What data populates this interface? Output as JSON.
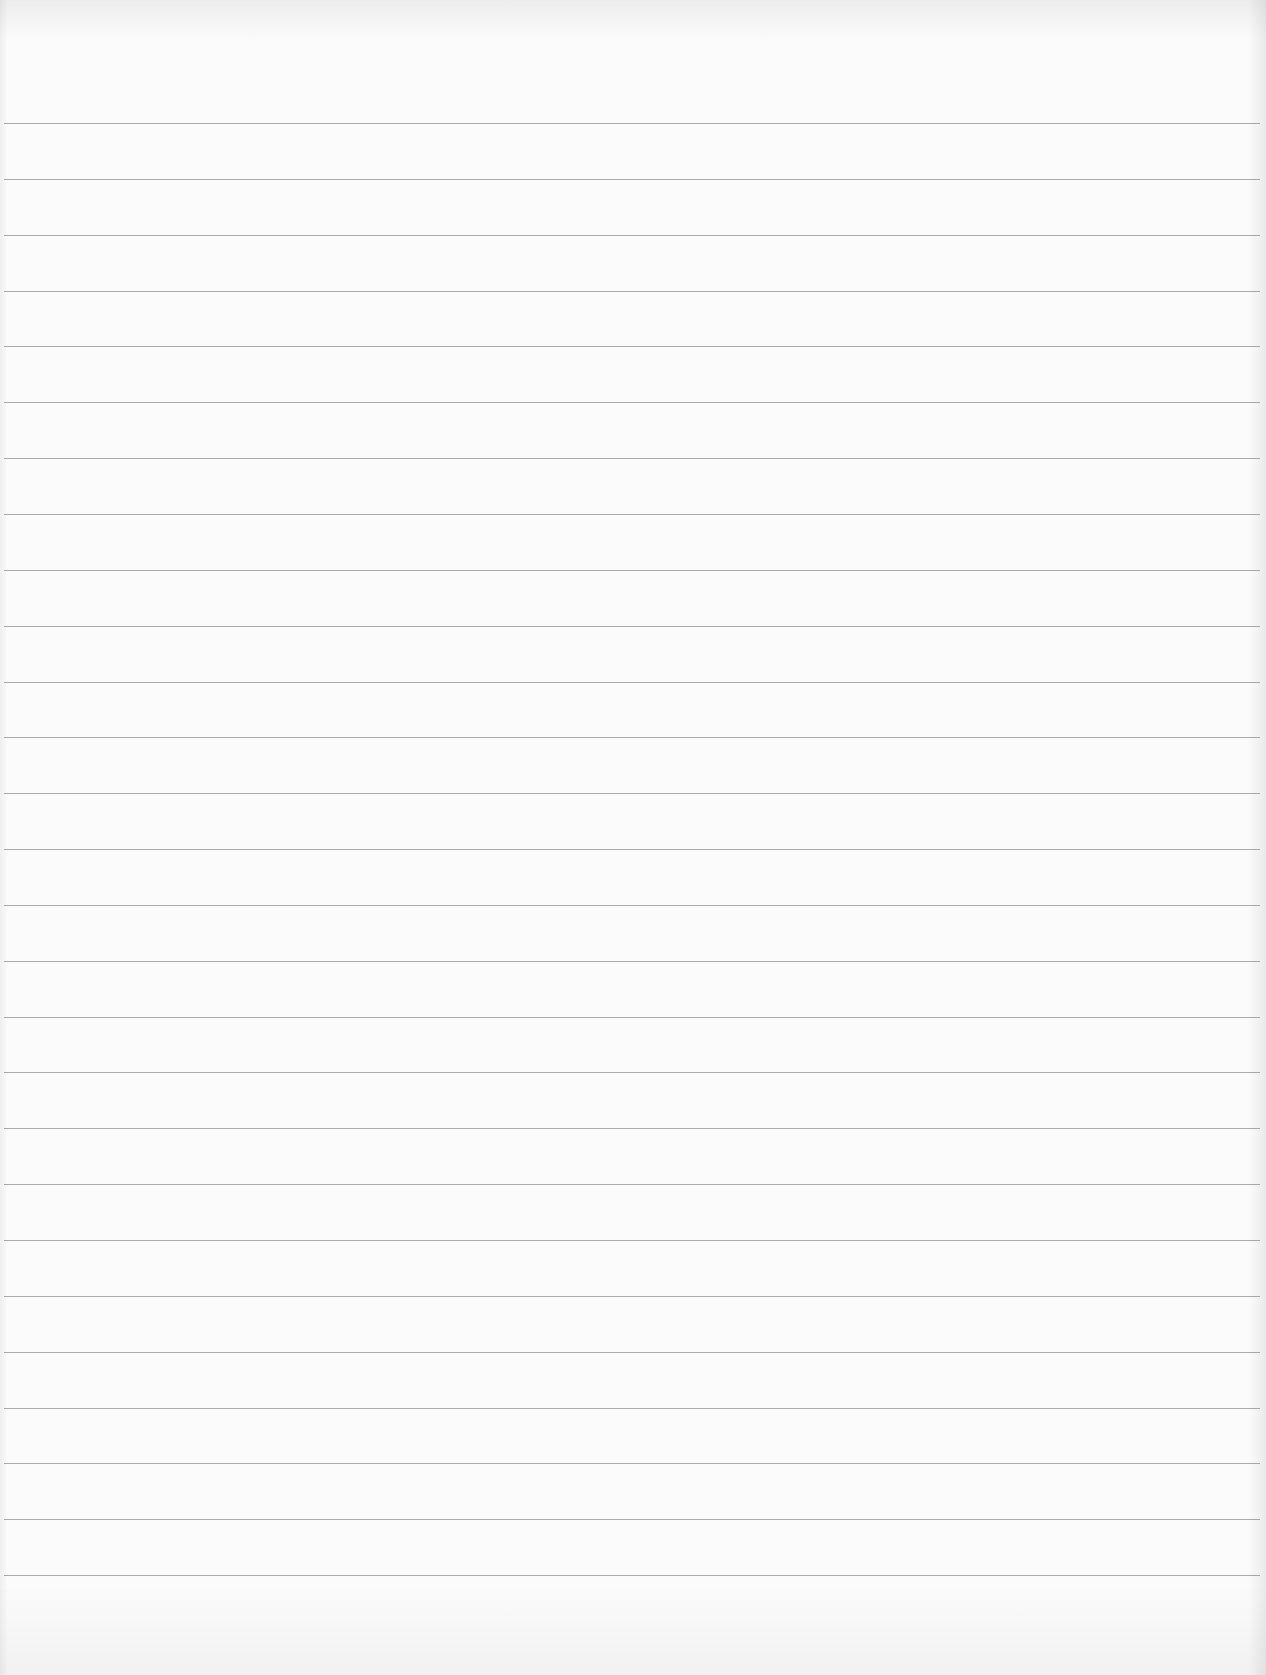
{
  "page": {
    "type": "lined-paper",
    "background_color": "#fbfbfb",
    "rule_color": "#9c9c9c",
    "rule_count": 27,
    "first_rule_y": 123,
    "rule_spacing": 55.85,
    "rule_left": 4,
    "rule_width": 1256,
    "text": ""
  }
}
